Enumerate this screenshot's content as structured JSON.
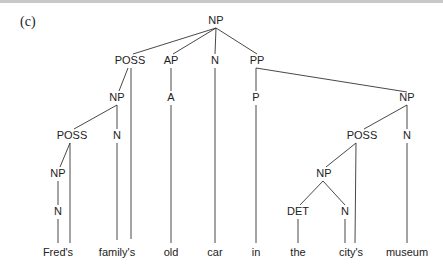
{
  "figure": {
    "label": "(c)",
    "type": "syntax-tree",
    "nodes": [
      {
        "id": "np0",
        "text": "NP",
        "x": 216,
        "y": 24
      },
      {
        "id": "poss1",
        "text": "POSS",
        "x": 130,
        "y": 64
      },
      {
        "id": "ap",
        "text": "AP",
        "x": 171,
        "y": 64
      },
      {
        "id": "n_car",
        "text": "N",
        "x": 215,
        "y": 64
      },
      {
        "id": "pp",
        "text": "PP",
        "x": 257,
        "y": 64
      },
      {
        "id": "np1",
        "text": "NP",
        "x": 117,
        "y": 101
      },
      {
        "id": "a",
        "text": "A",
        "x": 171,
        "y": 101
      },
      {
        "id": "p",
        "text": "P",
        "x": 256,
        "y": 101
      },
      {
        "id": "np2",
        "text": "NP",
        "x": 407,
        "y": 101
      },
      {
        "id": "poss2",
        "text": "POSS",
        "x": 72,
        "y": 139
      },
      {
        "id": "n_family",
        "text": "N",
        "x": 117,
        "y": 139
      },
      {
        "id": "poss3",
        "text": "POSS",
        "x": 362,
        "y": 139
      },
      {
        "id": "n_museum",
        "text": "N",
        "x": 407,
        "y": 139
      },
      {
        "id": "np3",
        "text": "NP",
        "x": 58,
        "y": 177
      },
      {
        "id": "np4",
        "text": "NP",
        "x": 324,
        "y": 177
      },
      {
        "id": "n_fred",
        "text": "N",
        "x": 58,
        "y": 215
      },
      {
        "id": "det",
        "text": "DET",
        "x": 298,
        "y": 215
      },
      {
        "id": "n_city",
        "text": "N",
        "x": 345,
        "y": 215
      }
    ],
    "words": [
      {
        "text": "Fred's",
        "x": 58
      },
      {
        "text": "family's",
        "x": 117
      },
      {
        "text": "old",
        "x": 171
      },
      {
        "text": "car",
        "x": 215
      },
      {
        "text": "in",
        "x": 256
      },
      {
        "text": "the",
        "x": 298
      },
      {
        "text": "city's",
        "x": 351
      },
      {
        "text": "museum",
        "x": 407
      }
    ],
    "word_y": 253
  }
}
